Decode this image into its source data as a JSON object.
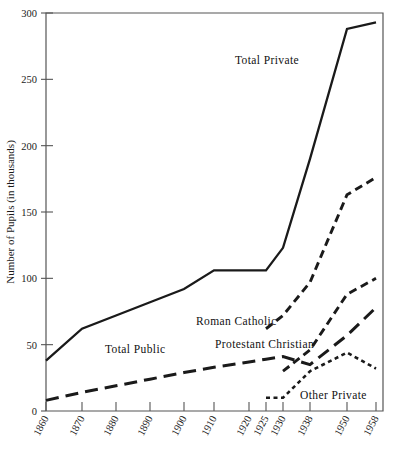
{
  "chart_data": {
    "type": "line",
    "title": "",
    "xlabel": "",
    "ylabel": "Number of Pupils (in thousands)",
    "ylim": [
      0,
      300
    ],
    "yticks": [
      0,
      50,
      100,
      150,
      200,
      250,
      300
    ],
    "ytick_labels": [
      "0",
      "50",
      "100",
      "150",
      "200",
      "250",
      "300"
    ],
    "categories": [
      "1860",
      "1870",
      "1880",
      "1890",
      "1900",
      "1910",
      "1920",
      "1925",
      "1930",
      "1938",
      "1950",
      "1958"
    ],
    "x_positions": [
      46,
      82,
      116,
      150,
      184,
      214,
      249,
      266,
      283,
      310,
      347,
      376
    ],
    "grid": false,
    "legend": "inline-annotations",
    "series": [
      {
        "name": "Total Private",
        "style": "solid",
        "x": [
          "1860",
          "1870",
          "1880",
          "1890",
          "1900",
          "1910",
          "1920",
          "1925",
          "1930",
          "1938",
          "1950",
          "1958"
        ],
        "values": [
          38,
          62,
          72,
          82,
          92,
          106,
          106,
          106,
          123,
          190,
          288,
          293
        ]
      },
      {
        "name": "Total Public",
        "style": "long-dash",
        "x": [
          "1860",
          "1870",
          "1880",
          "1890",
          "1900",
          "1910",
          "1920",
          "1925",
          "1930",
          "1938",
          "1950",
          "1958"
        ],
        "values": [
          8,
          14,
          19,
          24,
          29,
          33,
          37,
          39,
          41,
          35,
          57,
          78
        ]
      },
      {
        "name": "Roman Catholic",
        "style": "dash",
        "x": [
          "1925",
          "1930",
          "1938",
          "1950",
          "1958"
        ],
        "values": [
          62,
          72,
          97,
          163,
          176
        ]
      },
      {
        "name": "Protestant Christian",
        "style": "dash",
        "x": [
          "1930",
          "1938",
          "1950",
          "1958"
        ],
        "values": [
          30,
          46,
          88,
          100
        ]
      },
      {
        "name": "Other Private",
        "style": "dot",
        "x": [
          "1925",
          "1930",
          "1938",
          "1950",
          "1958"
        ],
        "values": [
          10,
          10,
          30,
          44,
          32
        ]
      }
    ],
    "annotations": [
      {
        "text": "Total Private",
        "x": 235,
        "y": 64
      },
      {
        "text": "Roman Catholic",
        "x": 196,
        "y": 325
      },
      {
        "text": "Protestant Christian",
        "x": 215,
        "y": 348
      },
      {
        "text": "Total Public",
        "x": 105,
        "y": 353
      },
      {
        "text": "Other Private",
        "x": 300,
        "y": 399
      }
    ]
  },
  "colors": {
    "ink": "#1a1a1a",
    "axis": "#555555",
    "background": "#ffffff"
  }
}
